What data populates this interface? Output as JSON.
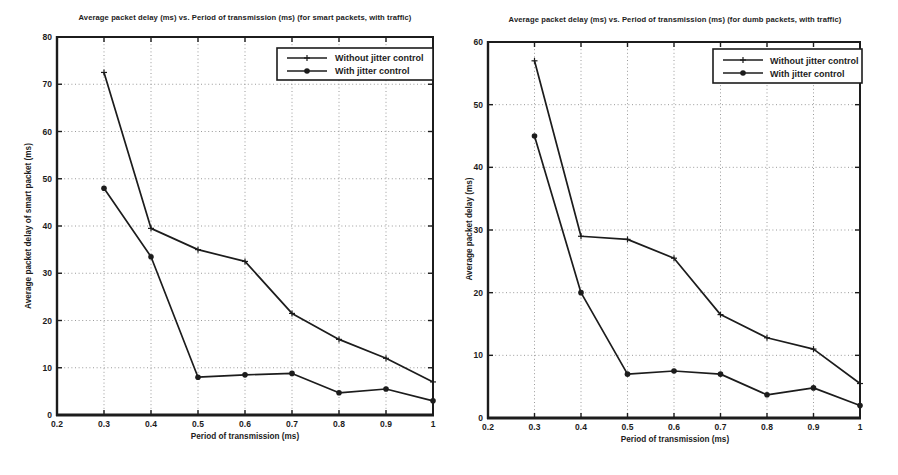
{
  "page": {
    "background": "#ffffff",
    "ink_color": "#1c1c1c",
    "grid_color": "#9a9a9a"
  },
  "chart_data": [
    {
      "type": "line",
      "title": "Average packet delay (ms) vs. Period of transmission (ms) (for smart packets, with traffic)",
      "xlabel": "Period of transmission (ms)",
      "ylabel": "Average packet delay of smart packet (ms)",
      "xlim": [
        0.2,
        1
      ],
      "ylim": [
        0,
        80
      ],
      "xticks": [
        0.2,
        0.3,
        0.4,
        0.5,
        0.6,
        0.7,
        0.8,
        0.9,
        1
      ],
      "xtick_labels": [
        "0.2",
        "0.3",
        "0.4",
        "0.5",
        "0.6",
        "0.7",
        "0.8",
        "0.9",
        "1"
      ],
      "yticks": [
        0,
        10,
        20,
        30,
        40,
        50,
        60,
        70,
        80
      ],
      "ytick_labels": [
        "0",
        "10",
        "20",
        "30",
        "40",
        "50",
        "60",
        "70",
        "80"
      ],
      "grid": true,
      "legend_position": "top-right",
      "x": [
        0.3,
        0.4,
        0.5,
        0.6,
        0.7,
        0.8,
        0.9,
        1.0
      ],
      "series": [
        {
          "name": "Without jitter control",
          "marker": "plus",
          "values": [
            72.5,
            39.5,
            35.0,
            32.5,
            21.5,
            16.0,
            12.0,
            7.0
          ]
        },
        {
          "name": "With jitter control",
          "marker": "dot",
          "values": [
            48.0,
            33.5,
            8.0,
            8.5,
            8.8,
            4.7,
            5.5,
            3.0
          ]
        }
      ]
    },
    {
      "type": "line",
      "title": "Average packet delay (ms) vs. Period of transmission (ms) (for dumb packets, with traffic)",
      "xlabel": "Period of transmission (ms)",
      "ylabel": "Average packet delay (ms)",
      "xlim": [
        0.2,
        1
      ],
      "ylim": [
        0,
        60
      ],
      "xticks": [
        0.2,
        0.3,
        0.4,
        0.5,
        0.6,
        0.7,
        0.8,
        0.9,
        1
      ],
      "xtick_labels": [
        "0.2",
        "0.3",
        "0.4",
        "0.5",
        "0.6",
        "0.7",
        "0.8",
        "0.9",
        "1"
      ],
      "yticks": [
        0,
        10,
        20,
        30,
        40,
        50,
        60
      ],
      "ytick_labels": [
        "0",
        "10",
        "20",
        "30",
        "40",
        "50",
        "60"
      ],
      "grid": true,
      "legend_position": "top-right",
      "x": [
        0.3,
        0.4,
        0.5,
        0.6,
        0.7,
        0.8,
        0.9,
        1.0
      ],
      "series": [
        {
          "name": "Without jitter control",
          "marker": "plus",
          "values": [
            57.0,
            29.0,
            28.5,
            25.5,
            16.5,
            12.8,
            11.0,
            5.5
          ]
        },
        {
          "name": "With jitter control",
          "marker": "dot",
          "values": [
            45.0,
            20.0,
            7.0,
            7.5,
            7.0,
            3.7,
            4.8,
            2.0
          ]
        }
      ]
    }
  ]
}
